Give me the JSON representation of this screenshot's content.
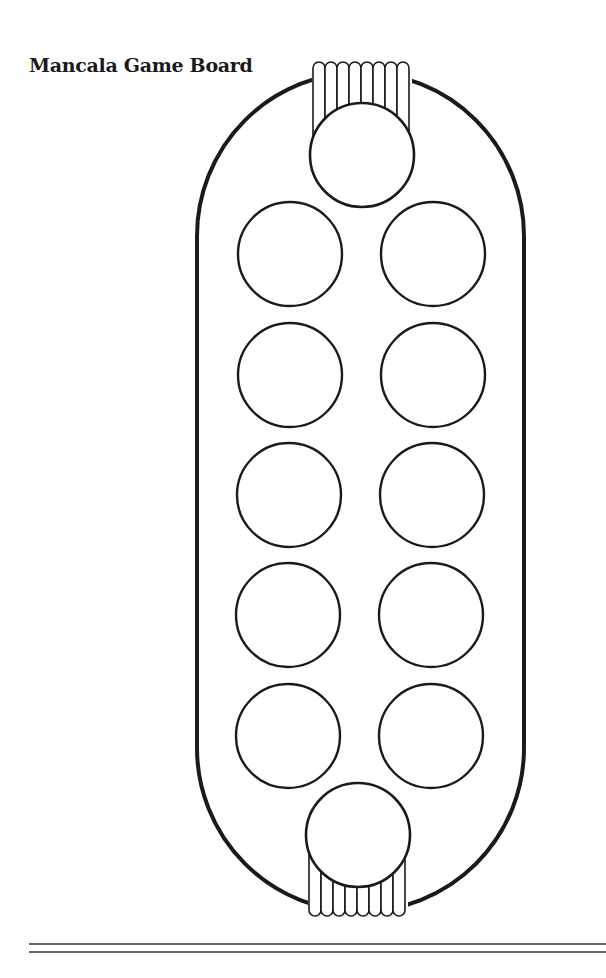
{
  "title": "Mancala Game Board",
  "colors": {
    "stroke": "#1a1a1a",
    "background": "#ffffff"
  },
  "board": {
    "shape": "stadium",
    "orientation": "vertical",
    "stores": [
      {
        "id": "store-top",
        "position": "top",
        "fringe_strips": 8
      },
      {
        "id": "store-bottom",
        "position": "bottom",
        "fringe_strips": 8
      }
    ],
    "pits": {
      "rows": 5,
      "columns": 2,
      "left_column": [
        "pit-1",
        "pit-2",
        "pit-3",
        "pit-4",
        "pit-5"
      ],
      "right_column": [
        "pit-6",
        "pit-7",
        "pit-8",
        "pit-9",
        "pit-10"
      ]
    }
  },
  "footer": {
    "double_rule": true
  }
}
